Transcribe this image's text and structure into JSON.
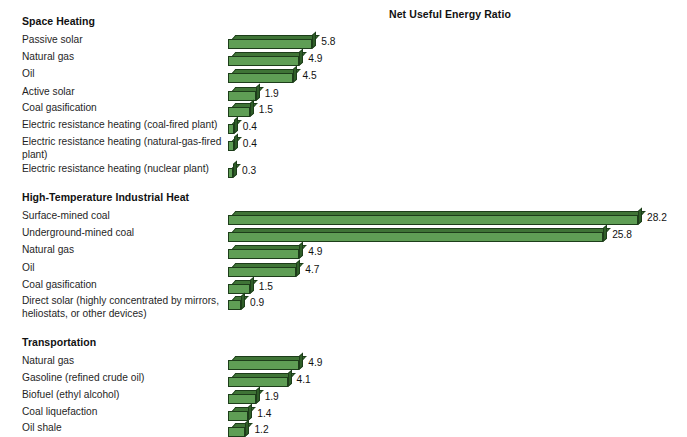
{
  "chart": {
    "title": "Net Useful Energy Ratio",
    "bar_color": "#5f9e55",
    "bar_top_color": "#3f7436",
    "bar_side_color": "#2f5e28",
    "bar_outline_color": "#1d3d1a",
    "background": "#ffffff"
  },
  "chart_data": {
    "type": "bar",
    "orientation": "horizontal",
    "title": "Net Useful Energy Ratio",
    "xlabel": "Net Useful Energy Ratio",
    "ylabel": "",
    "xlim": [
      0,
      28.2
    ],
    "grid": false,
    "legend": "none",
    "groups": [
      {
        "name": "Space Heating",
        "categories": [
          "Passive solar",
          "Natural gas",
          "Oil",
          "Active solar",
          "Coal gasification",
          "Electric resistance heating (coal-fired plant)",
          "Electric resistance heating (natural-gas-fired plant)",
          "Electric resistance heating (nuclear plant)"
        ],
        "values": [
          5.8,
          4.9,
          4.5,
          1.9,
          1.5,
          0.4,
          0.4,
          0.3
        ]
      },
      {
        "name": "High-Temperature Industrial Heat",
        "categories": [
          "Surface-mined coal",
          "Underground-mined coal",
          "Natural gas",
          "Oil",
          "Coal gasification",
          "Direct solar (highly concentrated by mirrors, heliostats, or other devices)"
        ],
        "values": [
          28.2,
          25.8,
          4.9,
          4.7,
          1.5,
          0.9
        ]
      },
      {
        "name": "Transportation",
        "categories": [
          "Natural gas",
          "Gasoline (refined crude oil)",
          "Biofuel (ethyl alcohol)",
          "Coal liquefaction",
          "Oil shale"
        ],
        "values": [
          4.9,
          4.1,
          1.9,
          1.4,
          1.2
        ]
      }
    ]
  },
  "sections": [
    {
      "heading": "Space Heating",
      "heading_top": 15,
      "rows": [
        {
          "label": "Passive solar",
          "value": "5.8",
          "top": 33
        },
        {
          "label": "Natural gas",
          "value": "4.9",
          "top": 50
        },
        {
          "label": "Oil",
          "value": "4.5",
          "top": 67
        },
        {
          "label": "Active solar",
          "value": "1.9",
          "top": 85
        },
        {
          "label": "Coal gasification",
          "value": "1.5",
          "top": 101
        },
        {
          "label": "Electric resistance heating (coal-fired plant)",
          "value": "0.4",
          "top": 118
        },
        {
          "label": "Electric resistance heating (natural-gas-fired plant)",
          "value": "0.4",
          "top": 135,
          "two_line": true
        },
        {
          "label": "Electric resistance heating (nuclear plant)",
          "value": "0.3",
          "top": 162
        }
      ]
    },
    {
      "heading": "High-Temperature Industrial Heat",
      "heading_top": 191,
      "rows": [
        {
          "label": "Surface-mined coal",
          "value": "28.2",
          "top": 209
        },
        {
          "label": "Underground-mined coal",
          "value": "25.8",
          "top": 226
        },
        {
          "label": "Natural gas",
          "value": "4.9",
          "top": 243
        },
        {
          "label": "Oil",
          "value": "4.7",
          "top": 261
        },
        {
          "label": "Coal gasification",
          "value": "1.5",
          "top": 278
        },
        {
          "label": "Direct solar (highly concentrated by mirrors, heliostats, or other devices)",
          "value": "0.9",
          "top": 294,
          "two_line": true
        }
      ]
    },
    {
      "heading": "Transportation",
      "heading_top": 336,
      "rows": [
        {
          "label": "Natural gas",
          "value": "4.9",
          "top": 354
        },
        {
          "label": "Gasoline (refined crude oil)",
          "value": "4.1",
          "top": 371
        },
        {
          "label": "Biofuel (ethyl alcohol)",
          "value": "1.9",
          "top": 388
        },
        {
          "label": "Coal liquefaction",
          "value": "1.4",
          "top": 405
        },
        {
          "label": "Oil shale",
          "value": "1.2",
          "top": 421
        }
      ]
    }
  ]
}
